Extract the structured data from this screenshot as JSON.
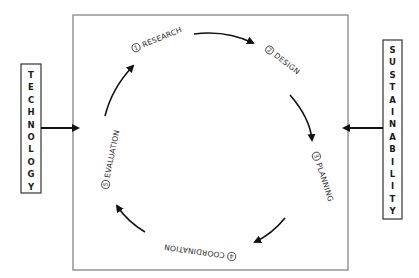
{
  "diagram": {
    "left_input": {
      "label": "TECHNOLOGY",
      "letters": [
        "T",
        "E",
        "C",
        "H",
        "N",
        "O",
        "L",
        "O",
        "G",
        "Y"
      ]
    },
    "right_input": {
      "label": "SUSTAINABILITY",
      "letters": [
        "S",
        "U",
        "S",
        "T",
        "A",
        "I",
        "N",
        "A",
        "B",
        "I",
        "L",
        "I",
        "T",
        "Y"
      ]
    },
    "cycle": {
      "direction": "clockwise",
      "steps": [
        {
          "number": "1",
          "label": "RESEARCH"
        },
        {
          "number": "2",
          "label": "DESIGN"
        },
        {
          "number": "3",
          "label": "PLANNING"
        },
        {
          "number": "4",
          "label": "COORDINATION"
        },
        {
          "number": "5",
          "label": "EVALUATION"
        }
      ]
    },
    "colors": {
      "stroke": "#111111",
      "frame": "#7a7a7a",
      "text": "#2a2a2a"
    }
  }
}
